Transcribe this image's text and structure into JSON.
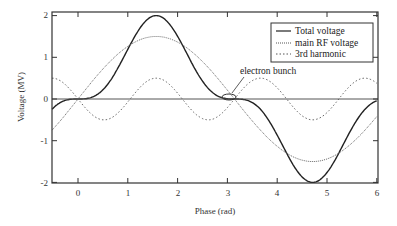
{
  "chart_data": {
    "type": "line",
    "title": "",
    "xlabel": "Phase (rad)",
    "ylabel": "Voltage (MV)",
    "xlim": [
      -0.52,
      6.0
    ],
    "ylim": [
      -2.05,
      2.1
    ],
    "xticks": [
      0,
      1,
      2,
      3,
      4,
      5,
      6
    ],
    "yticks": [
      -2,
      -1,
      0,
      1,
      2
    ],
    "grid": false,
    "legend_position": "upper right",
    "series": [
      {
        "name": "Total voltage",
        "style": "solid",
        "formula": "1.5*sin(x) - 0.5*sin(3x)",
        "peak": 2.0,
        "trough": -2.0
      },
      {
        "name": "main RF voltage",
        "style": "dense-dotted",
        "formula": "1.5*sin(x)",
        "peak": 1.5,
        "trough": -1.5
      },
      {
        "name": "3rd harmonic",
        "style": "dotted",
        "formula": "-0.5*sin(3x)",
        "peak": 0.5,
        "trough": -0.5
      }
    ],
    "annotations": [
      {
        "text": "electron bunch",
        "x": 3.14,
        "y": 0.0
      }
    ]
  },
  "labels": {
    "xlabel": "Phase (rad)",
    "ylabel": "Voltage (MV)",
    "x_ticks": [
      "0",
      "1",
      "2",
      "3",
      "4",
      "5",
      "6"
    ],
    "y_ticks": [
      "2",
      "1",
      "0",
      "-1",
      "-2"
    ],
    "legend": [
      "Total voltage",
      "main RF voltage",
      "3rd harmonic"
    ],
    "annotation": "electron bunch"
  }
}
